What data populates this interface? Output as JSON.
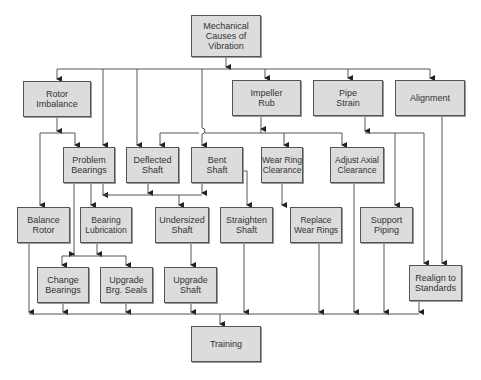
{
  "diagram": {
    "title": "Mechanical Causes of Vibration",
    "nodes": {
      "root": {
        "label": "Mechanical\nCauses of\nVibration",
        "x": 191,
        "y": 15,
        "w": 70,
        "h": 42
      },
      "rotor_imbalance": {
        "label": "Rotor\nImbalance",
        "x": 23,
        "y": 81,
        "w": 68,
        "h": 36
      },
      "impeller_rub": {
        "label": "Impeller\nRub",
        "x": 232,
        "y": 80,
        "w": 69,
        "h": 36
      },
      "pipe_strain": {
        "label": "Pipe\nStrain",
        "x": 313,
        "y": 80,
        "w": 70,
        "h": 36
      },
      "alignment": {
        "label": "Alignment",
        "x": 395,
        "y": 80,
        "w": 70,
        "h": 36
      },
      "problem_bearings": {
        "label": "Problem\nBearings",
        "x": 63,
        "y": 147,
        "w": 52,
        "h": 36
      },
      "deflected_shaft": {
        "label": "Deflected\nShaft",
        "x": 126,
        "y": 147,
        "w": 53,
        "h": 36
      },
      "bent_shaft": {
        "label": "Bent\nShaft",
        "x": 191,
        "y": 147,
        "w": 52,
        "h": 36
      },
      "wear_ring_clearance": {
        "label": "Wear Ring\nClearance",
        "x": 261,
        "y": 147,
        "w": 42,
        "h": 36
      },
      "adjust_axial_clearance": {
        "label": "Adjust Axial\nClearance",
        "x": 330,
        "y": 147,
        "w": 54,
        "h": 36
      },
      "balance_rotor": {
        "label": "Balance\nRotor",
        "x": 17,
        "y": 207,
        "w": 53,
        "h": 36
      },
      "bearing_lubrication": {
        "label": "Bearing\nLubrication",
        "x": 80,
        "y": 207,
        "w": 52,
        "h": 36
      },
      "undersized_shaft": {
        "label": "Undersized\nShaft",
        "x": 155,
        "y": 207,
        "w": 54,
        "h": 36
      },
      "straighten_shaft": {
        "label": "Straighten\nShaft",
        "x": 220,
        "y": 207,
        "w": 53,
        "h": 36
      },
      "replace_wear_rings": {
        "label": "Replace\nWear Rings",
        "x": 290,
        "y": 207,
        "w": 52,
        "h": 36
      },
      "support_piping": {
        "label": "Support\nPiping",
        "x": 360,
        "y": 207,
        "w": 53,
        "h": 36
      },
      "change_bearings": {
        "label": "Change\nBearings",
        "x": 37,
        "y": 267,
        "w": 52,
        "h": 36
      },
      "upgrade_brg_seals": {
        "label": "Upgrade\nBrg. Seals",
        "x": 100,
        "y": 267,
        "w": 53,
        "h": 36
      },
      "upgrade_shaft": {
        "label": "Upgrade\nShaft",
        "x": 164,
        "y": 267,
        "w": 53,
        "h": 36
      },
      "realign_to_standards": {
        "label": "Realign to\nStandards",
        "x": 409,
        "y": 265,
        "w": 53,
        "h": 36
      },
      "training": {
        "label": "Training",
        "x": 191,
        "y": 326,
        "w": 70,
        "h": 36
      }
    },
    "edges": [
      [
        "root",
        "rotor_imbalance"
      ],
      [
        "root",
        "problem_bearings"
      ],
      [
        "root",
        "deflected_shaft"
      ],
      [
        "root",
        "bent_shaft"
      ],
      [
        "root",
        "impeller_rub"
      ],
      [
        "root",
        "pipe_strain"
      ],
      [
        "root",
        "alignment"
      ],
      [
        "rotor_imbalance",
        "problem_bearings"
      ],
      [
        "rotor_imbalance",
        "balance_rotor"
      ],
      [
        "impeller_rub",
        "deflected_shaft"
      ],
      [
        "impeller_rub",
        "wear_ring_clearance"
      ],
      [
        "impeller_rub",
        "adjust_axial_clearance"
      ],
      [
        "pipe_strain",
        "support_piping"
      ],
      [
        "pipe_strain",
        "realign_to_standards"
      ],
      [
        "alignment",
        "realign_to_standards"
      ],
      [
        "problem_bearings",
        "bearing_lubrication"
      ],
      [
        "problem_bearings",
        "change_bearings"
      ],
      [
        "problem_bearings",
        "upgrade_brg_seals"
      ],
      [
        "bearing_lubrication",
        "change_bearings"
      ],
      [
        "bearing_lubrication",
        "upgrade_brg_seals"
      ],
      [
        "problem_bearings",
        "undersized_shaft"
      ],
      [
        "deflected_shaft",
        "undersized_shaft"
      ],
      [
        "bent_shaft",
        "undersized_shaft"
      ],
      [
        "bent_shaft",
        "straighten_shaft"
      ],
      [
        "wear_ring_clearance",
        "replace_wear_rings"
      ],
      [
        "undersized_shaft",
        "upgrade_shaft"
      ],
      [
        "balance_rotor",
        "training"
      ],
      [
        "change_bearings",
        "training"
      ],
      [
        "upgrade_brg_seals",
        "training"
      ],
      [
        "upgrade_shaft",
        "training"
      ],
      [
        "straighten_shaft",
        "training"
      ],
      [
        "replace_wear_rings",
        "training"
      ],
      [
        "adjust_axial_clearance",
        "training"
      ],
      [
        "support_piping",
        "training"
      ],
      [
        "realign_to_standards",
        "training"
      ]
    ],
    "colors": {
      "box_fill": "#dcdcdc",
      "box_border": "#555555",
      "line": "#555555",
      "text": "#333333"
    }
  }
}
